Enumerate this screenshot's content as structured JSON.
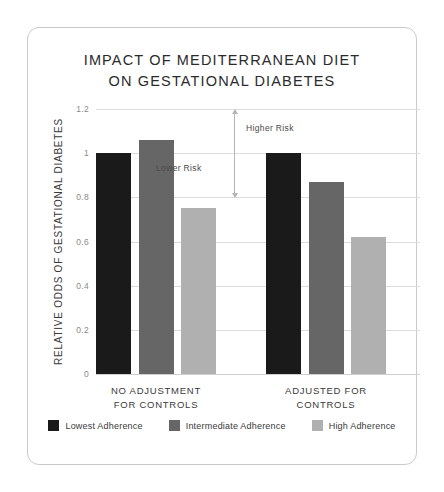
{
  "chart_data": {
    "type": "bar",
    "title": "IMPACT OF MEDITERRANEAN DIET ON GESTATIONAL DIABETES",
    "title_line1": "IMPACT OF MEDITERRANEAN DIET",
    "title_line2": "ON GESTATIONAL DIABETES",
    "xlabel": "",
    "ylabel": "RELATIVE ODDS OF GESTATIONAL DIABETES",
    "ylim": [
      0,
      1.2
    ],
    "ytick_labels": [
      "1.2",
      "1",
      "0.8",
      "0.6",
      "0.4",
      "0.2",
      "0"
    ],
    "ytick_values": [
      1.2,
      1,
      0.8,
      0.6,
      0.4,
      0.2,
      0
    ],
    "grid": true,
    "legend_position": "bottom",
    "categories": [
      "NO ADJUSTMENT FOR CONTROLS",
      "ADJUSTED FOR CONTROLS"
    ],
    "category_lines": [
      [
        "NO ADJUSTMENT",
        "FOR CONTROLS"
      ],
      [
        "ADJUSTED FOR",
        "CONTROLS"
      ]
    ],
    "series": [
      {
        "name": "Lowest Adherence",
        "color": "#1a1a1a",
        "values": [
          1.0,
          1.0
        ]
      },
      {
        "name": "Intermediate Adherence",
        "color": "#666666",
        "values": [
          1.06,
          0.87
        ]
      },
      {
        "name": "High Adherence",
        "color": "#b0b0b0",
        "values": [
          0.75,
          0.62
        ]
      }
    ],
    "annotations": [
      {
        "name": "higher-risk",
        "label": "Higher Risk",
        "direction": "up",
        "reference_value": 1.0
      },
      {
        "name": "lower-risk",
        "label": "Lower Risk",
        "direction": "down",
        "reference_value": 1.0
      }
    ]
  },
  "colors": {
    "background": "#ffffff",
    "card_border": "#c9c9c9",
    "gridline": "#dcdcdc",
    "text": "#2b2b2b",
    "muted_text": "#8a8a8a",
    "annotation": "#b5b5b5"
  }
}
